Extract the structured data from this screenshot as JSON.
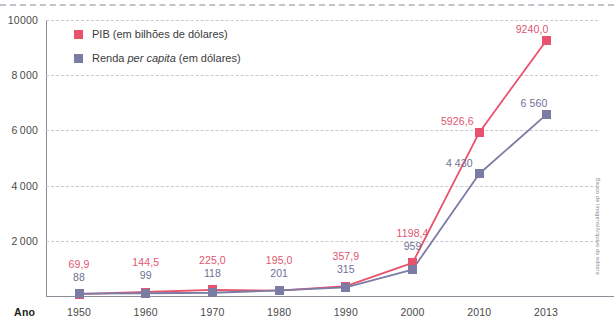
{
  "chart_data": {
    "type": "line",
    "title": "",
    "xlabel": "Ano",
    "ylabel": "",
    "categories": [
      "1950",
      "1960",
      "1970",
      "1980",
      "1990",
      "2000",
      "2010",
      "2013"
    ],
    "x": [
      1950,
      1960,
      1970,
      1980,
      1990,
      2000,
      2010,
      2013
    ],
    "ylim": [
      0,
      10000
    ],
    "yticks": [
      2000,
      4000,
      6000,
      8000,
      10000
    ],
    "ytick_labels": [
      "2000",
      "4000",
      "6000",
      "8000",
      "10000"
    ],
    "grid": true,
    "legend_position": "top-left",
    "series": [
      {
        "name": "PIB (em bilhões de dólares)",
        "color": "#e8526d",
        "values": [
          69.9,
          144.5,
          225.0,
          195.0,
          357.9,
          1198.4,
          5926.6,
          9240.0
        ],
        "labels": [
          "69,9",
          "144,5",
          "225,0",
          "195,0",
          "357,9",
          "1198,4",
          "5926,6",
          "9240,0"
        ]
      },
      {
        "name": "Renda per capita (em dólares)",
        "color": "#7b7ca4",
        "values": [
          88,
          99,
          118,
          201,
          315,
          959,
          4430,
          6560
        ],
        "labels": [
          "88",
          "99",
          "118",
          "201",
          "315",
          "959",
          "4 430",
          "6 560"
        ]
      }
    ]
  },
  "legend": {
    "items": [
      {
        "swatch_color": "#e8526d",
        "text_before": "PIB (em bilhões de dólares)",
        "italic": "",
        "text_after": ""
      },
      {
        "swatch_color": "#7b7ca4",
        "text_before": "Renda ",
        "italic": "per capita",
        "text_after": " (em dólares)"
      }
    ]
  },
  "axis": {
    "x_title": "Ano"
  },
  "credit": {
    "text": "Banco de imagens/Arquivo da editora"
  },
  "colors": {
    "pib": "#e8526d",
    "renda": "#7b7ca4",
    "grid": "#c9c9d2",
    "axis": "#8e8e99",
    "tick_text": "#4a4a4a"
  }
}
